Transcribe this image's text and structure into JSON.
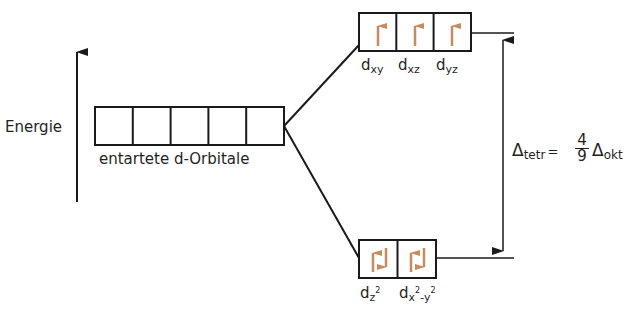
{
  "axis": {
    "label": "Energie"
  },
  "degenerate": {
    "label": "entartete d-Orbitale",
    "count": 5
  },
  "upper_set": {
    "orbitals": [
      {
        "name": "d",
        "sub": "xy",
        "electrons": "up"
      },
      {
        "name": "d",
        "sub": "xz",
        "electrons": "up"
      },
      {
        "name": "d",
        "sub": "yz",
        "electrons": "up"
      }
    ]
  },
  "lower_set": {
    "orbitals": [
      {
        "name": "d",
        "sub": "z",
        "sup": "2",
        "electrons": "up-down"
      },
      {
        "name": "d",
        "sub": "x",
        "sup": "2",
        "sub2": "-y",
        "sup2": "2",
        "electrons": "up-down"
      }
    ]
  },
  "splitting": {
    "delta": "Δ",
    "left_sub": "tetr",
    "equals": "=",
    "numerator": "4",
    "denominator": "9",
    "right_sub": "okt"
  },
  "colors": {
    "line": "#1a1a1a",
    "electron": "#c98a5e"
  }
}
